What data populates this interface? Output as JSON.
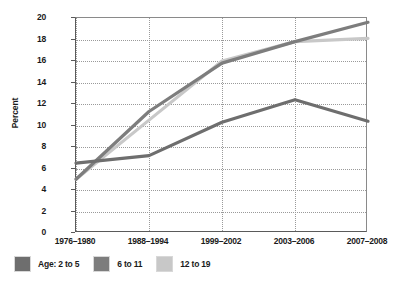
{
  "chart_data": {
    "type": "line",
    "title": "",
    "xlabel": "",
    "ylabel": "Percent",
    "categories": [
      "1976–1980",
      "1988–1994",
      "1999–2002",
      "2003–2006",
      "2007–2008"
    ],
    "ylim": [
      0,
      20
    ],
    "yticks": [
      0,
      2,
      4,
      6,
      8,
      10,
      12,
      14,
      16,
      18,
      20
    ],
    "grid": true,
    "legend_position": "bottom-left",
    "legend_prefix": "Age:",
    "series": [
      {
        "name": "2 to 5",
        "color": "#6e6e6e",
        "values": [
          6.5,
          7.2,
          10.3,
          12.4,
          10.4
        ]
      },
      {
        "name": "6 to 11",
        "color": "#7d7d7d",
        "values": [
          5.0,
          11.3,
          15.8,
          17.8,
          19.6
        ]
      },
      {
        "name": "12 to 19",
        "color": "#c8c8c8",
        "values": [
          5.0,
          10.5,
          16.0,
          17.8,
          18.1
        ]
      }
    ]
  },
  "axis": {
    "y_label": "Percent",
    "y_tick_labels": [
      "20",
      "18",
      "16",
      "14",
      "12",
      "10",
      "8",
      "6",
      "4",
      "2",
      "0"
    ],
    "x_tick_labels": [
      "1976–1980",
      "1988–1994",
      "1999–2002",
      "2003–2006",
      "2007–2008"
    ]
  },
  "legend": {
    "items": [
      {
        "label": "Age:  2 to 5",
        "color": "#6e6e6e"
      },
      {
        "label": "6 to 11",
        "color": "#7d7d7d"
      },
      {
        "label": "12 to 19",
        "color": "#c8c8c8"
      }
    ]
  }
}
